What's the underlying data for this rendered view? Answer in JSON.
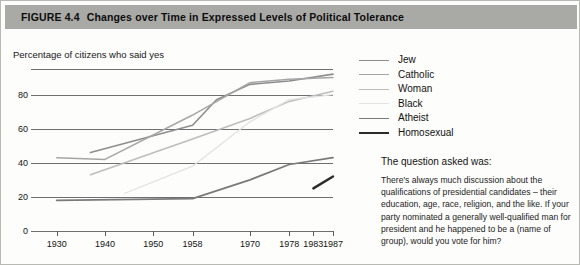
{
  "figure": {
    "number": "FIGURE 4.4",
    "title": "Changes over Time in Expressed Levels of Political Tolerance"
  },
  "legend": {
    "position": "right",
    "items": [
      {
        "label": "Jew",
        "color": "#8e8e8e",
        "width": 1.6
      },
      {
        "label": "Catholic",
        "color": "#a6a6a6",
        "width": 1.5
      },
      {
        "label": "Woman",
        "color": "#bdbdbd",
        "width": 1.5
      },
      {
        "label": "Black",
        "color": "#e2e2e2",
        "width": 1.3
      },
      {
        "label": "Atheist",
        "color": "#7a7a7a",
        "width": 1.7
      },
      {
        "label": "Homosexual",
        "color": "#2b2b2b",
        "width": 2.4
      }
    ]
  },
  "question": {
    "heading": "The question asked was:",
    "text": "There's always much discussion about the qualifications of presidential candidates – their education, age, race, religion, and the like. If your party nominated a generally well-qualified man for president and he happened to be a (name of group), would you vote for him?"
  },
  "chart_data": {
    "type": "line",
    "title": "Changes over Time in Expressed Levels of Political Tolerance",
    "ylabel": "Percentage of citizens who said yes",
    "xlabel": "",
    "ylim": [
      0,
      95
    ],
    "yticks": [
      0,
      20,
      40,
      60,
      80
    ],
    "grid": true,
    "xticks": [
      1930,
      1940,
      1950,
      1958,
      1970,
      1978,
      1983,
      1987
    ],
    "xtick_positions": [
      0.085,
      0.245,
      0.405,
      0.535,
      0.725,
      0.855,
      0.935,
      1.0
    ],
    "series": [
      {
        "name": "Jew",
        "color": "#8e8e8e",
        "width": 1.6,
        "points": [
          [
            1937,
            46
          ],
          [
            1958,
            62
          ],
          [
            1963,
            77
          ],
          [
            1970,
            86
          ],
          [
            1978,
            88
          ],
          [
            1987,
            92
          ]
        ]
      },
      {
        "name": "Catholic",
        "color": "#a6a6a6",
        "width": 1.5,
        "points": [
          [
            1930,
            43
          ],
          [
            1940,
            42
          ],
          [
            1958,
            68
          ],
          [
            1970,
            87
          ],
          [
            1978,
            89
          ],
          [
            1987,
            90
          ]
        ]
      },
      {
        "name": "Woman",
        "color": "#bdbdbd",
        "width": 1.5,
        "points": [
          [
            1937,
            33
          ],
          [
            1958,
            54
          ],
          [
            1970,
            66
          ],
          [
            1978,
            76
          ],
          [
            1987,
            82
          ]
        ]
      },
      {
        "name": "Black",
        "color": "#e2e2e2",
        "width": 1.3,
        "points": [
          [
            1944,
            22
          ],
          [
            1958,
            38
          ],
          [
            1970,
            64
          ],
          [
            1978,
            77
          ],
          [
            1987,
            80
          ]
        ]
      },
      {
        "name": "Atheist",
        "color": "#7a7a7a",
        "width": 1.7,
        "points": [
          [
            1930,
            18
          ],
          [
            1958,
            19
          ],
          [
            1970,
            30
          ],
          [
            1978,
            39
          ],
          [
            1987,
            43
          ]
        ]
      },
      {
        "name": "Homosexual",
        "color": "#2b2b2b",
        "width": 2.4,
        "points": [
          [
            1983,
            25
          ],
          [
            1987,
            32
          ]
        ]
      }
    ]
  }
}
